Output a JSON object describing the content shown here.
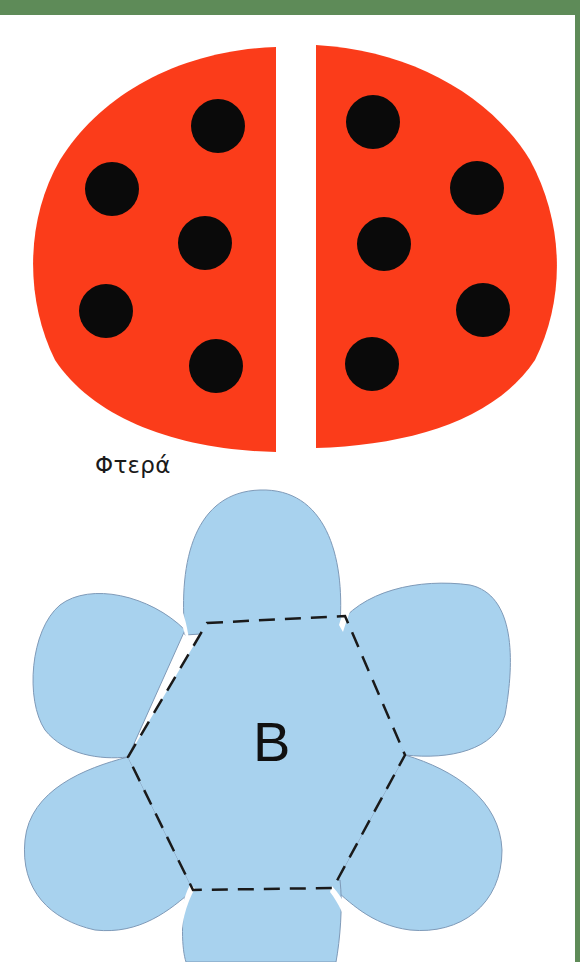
{
  "page": {
    "colors": {
      "frame_green": "#5e8b58",
      "wing_red": "#fb3c1a",
      "spot_black": "#0a0a0a",
      "flower_blue": "#a8d2ee",
      "flower_outline": "#7f9ab8",
      "dash": "#1a1a1a"
    }
  },
  "ladybug": {
    "label": "Φτερά",
    "left_wing": {
      "spots": [
        {
          "cx": 218,
          "cy": 126,
          "r": 27
        },
        {
          "cx": 112,
          "cy": 189,
          "r": 27
        },
        {
          "cx": 205,
          "cy": 243,
          "r": 27
        },
        {
          "cx": 106,
          "cy": 311,
          "r": 27
        },
        {
          "cx": 216,
          "cy": 366,
          "r": 27
        }
      ]
    },
    "right_wing": {
      "spots": [
        {
          "cx": 373,
          "cy": 122,
          "r": 27
        },
        {
          "cx": 477,
          "cy": 188,
          "r": 27
        },
        {
          "cx": 384,
          "cy": 244,
          "r": 27
        },
        {
          "cx": 483,
          "cy": 310,
          "r": 27
        },
        {
          "cx": 372,
          "cy": 364,
          "r": 27
        }
      ]
    }
  },
  "flower": {
    "letter": "B",
    "petal_count": 6,
    "fold_hexagon": [
      [
        207,
        623
      ],
      [
        345,
        616
      ],
      [
        405,
        755
      ],
      [
        333,
        888
      ],
      [
        193,
        890
      ],
      [
        128,
        757
      ]
    ]
  }
}
